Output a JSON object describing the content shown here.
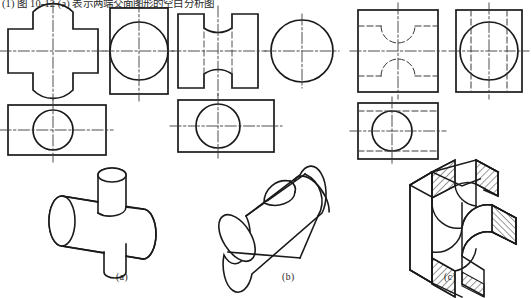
{
  "figure": {
    "caption_top": "(1) 图 10-12 (a) 表示两端交面图形的空白分析图",
    "group_labels": {
      "a": "(a)",
      "b": "(b)",
      "c": "(c)"
    },
    "colors": {
      "outline": "#1a1a1a",
      "center_line": "#3a3a3a",
      "hidden_line": "#3a3a3a",
      "hatch": "#1a1a1a",
      "background": "#ffffff"
    },
    "line_types": {
      "visible": "continuous thick",
      "hidden": "dashed",
      "center": "dash-dot"
    }
  },
  "groups": [
    {
      "id": "a",
      "label": "(a)",
      "views": [
        {
          "name": "front-view",
          "shape": "cross-shaped outline with concave arcs top and bottom",
          "features": [
            "vertical center line",
            "horizontal center line",
            "two concave arcs"
          ]
        },
        {
          "name": "left-view",
          "shape": "rectangle with inscribed circle",
          "features": [
            "vertical center line",
            "horizontal center line",
            "full circle"
          ]
        },
        {
          "name": "top-view",
          "shape": "rectangle with inscribed circle",
          "features": [
            "vertical center line",
            "horizontal center line",
            "full circle"
          ]
        }
      ],
      "solid": {
        "name": "tee-cylinder-solid",
        "description": "horizontal cylinder intersected by a smaller vertical cylinder forming a tee"
      }
    },
    {
      "id": "b",
      "label": "(b)",
      "views": [
        {
          "name": "front-view",
          "shape": "rectangle with waisted concave arcs top and bottom, hidden dashed lines",
          "features": [
            "vertical center line",
            "horizontal center line",
            "two hidden dashed lines",
            "two concave arcs"
          ]
        },
        {
          "name": "left-view",
          "shape": "circle with four short center line stubs",
          "features": [
            "vertical center line",
            "horizontal center line",
            "full circle"
          ]
        },
        {
          "name": "top-view",
          "shape": "rectangle with inscribed circle",
          "features": [
            "vertical center line",
            "horizontal center line",
            "full circle"
          ]
        }
      ],
      "solid": {
        "name": "grooved-cylinder-solid",
        "description": "horizontal cylinder with a cylindrical groove cut across the top surface"
      }
    },
    {
      "id": "c",
      "label": "(c)",
      "views": [
        {
          "name": "front-view",
          "shape": "rectangle with hidden dashed concave arcs top and bottom",
          "features": [
            "vertical center line",
            "horizontal center line",
            "hidden dashed arcs",
            "hidden dashed horizontal lines"
          ]
        },
        {
          "name": "left-view",
          "shape": "rectangle with inscribed circle and hidden dashed vertical lines",
          "features": [
            "vertical center line",
            "horizontal center line",
            "full circle",
            "two hidden dashed vertical lines"
          ]
        },
        {
          "name": "top-view",
          "shape": "rectangle with inscribed circle and hidden dashed horizontal lines",
          "features": [
            "vertical center line",
            "horizontal center line",
            "full circle",
            "two hidden dashed horizontal lines"
          ]
        }
      ],
      "solid": {
        "name": "cross-slot-block-solid",
        "description": "rectangular block with cross-shaped through slot, cut faces shown with section hatching"
      }
    }
  ]
}
